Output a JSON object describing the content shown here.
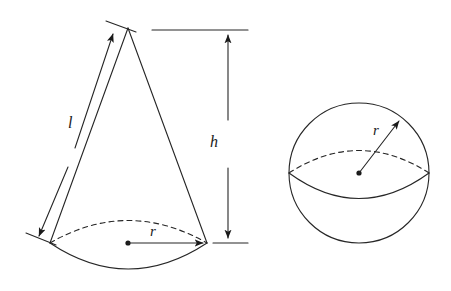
{
  "figure": {
    "background_color": "#ffffff",
    "stroke_color": "#262626",
    "label_color": "#1a1a1a",
    "stroke_width": 1.1
  },
  "shapes": {
    "cone": {
      "name": "cone",
      "apex": {
        "x": 128,
        "y": 28
      },
      "base_center": {
        "x": 128,
        "y": 243
      },
      "base_left": {
        "x": 50,
        "y": 243
      },
      "base_right": {
        "x": 207,
        "y": 243
      },
      "labels": {
        "slant_height": "l",
        "height": "h",
        "radius": "r"
      }
    },
    "sphere": {
      "name": "sphere",
      "center": {
        "x": 359,
        "y": 173
      },
      "radius": 70,
      "radius_endpoint": {
        "x": 402,
        "y": 118
      },
      "labels": {
        "radius": "r"
      }
    }
  },
  "annotations": [
    {
      "id": "cone-slant-dimension",
      "label": "l",
      "shape": "cone",
      "measures": "slant height"
    },
    {
      "id": "cone-height-dimension",
      "label": "h",
      "shape": "cone",
      "measures": "height"
    },
    {
      "id": "cone-radius-dimension",
      "label": "r",
      "shape": "cone",
      "measures": "base radius"
    },
    {
      "id": "sphere-radius-dimension",
      "label": "r",
      "shape": "sphere",
      "measures": "radius"
    }
  ]
}
